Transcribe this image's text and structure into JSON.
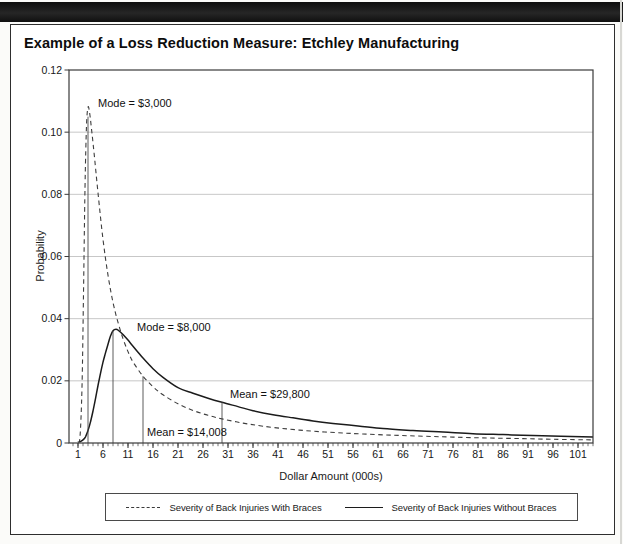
{
  "figure": {
    "title": "Example of a Loss Reduction Measure: Etchley Manufacturing"
  },
  "chart_data": {
    "type": "line",
    "title": "Example of a Loss Reduction Measure: Etchley Manufacturing",
    "xlabel": "Dollar Amount (000s)",
    "ylabel": "Probability",
    "xlim": [
      0,
      104
    ],
    "ylim": [
      0,
      0.12
    ],
    "grid": "horizontal",
    "legend_position": "bottom",
    "y_ticks": [
      {
        "value": 0,
        "label": "0"
      },
      {
        "value": 0.02,
        "label": "0.02"
      },
      {
        "value": 0.04,
        "label": "0.04"
      },
      {
        "value": 0.06,
        "label": "0.06"
      },
      {
        "value": 0.08,
        "label": "0.08"
      },
      {
        "value": 0.1,
        "label": "0.10"
      },
      {
        "value": 0.12,
        "label": "0.12"
      }
    ],
    "x_major_ticks": [
      1,
      6,
      11,
      16,
      21,
      26,
      31,
      36,
      41,
      46,
      51,
      56,
      61,
      66,
      71,
      76,
      81,
      86,
      91,
      96,
      101
    ],
    "x_minor_tick_step": 1,
    "series": [
      {
        "name": "Severity of Back Injuries With Braces",
        "style": "dashed",
        "mode": 3000,
        "mean": 14008,
        "points": [
          [
            1,
            0.0004
          ],
          [
            1.4,
            0.002
          ],
          [
            1.8,
            0.018
          ],
          [
            2.1,
            0.048
          ],
          [
            2.4,
            0.082
          ],
          [
            2.7,
            0.102
          ],
          [
            3,
            0.108
          ],
          [
            3.3,
            0.1065
          ],
          [
            3.7,
            0.101
          ],
          [
            4.2,
            0.0935
          ],
          [
            5,
            0.0805
          ],
          [
            6,
            0.0655
          ],
          [
            7,
            0.054
          ],
          [
            8,
            0.0452
          ],
          [
            9,
            0.0388
          ],
          [
            10,
            0.0336
          ],
          [
            11,
            0.0294
          ],
          [
            12,
            0.0261
          ],
          [
            14,
            0.0215
          ],
          [
            16,
            0.0181
          ],
          [
            18,
            0.0155
          ],
          [
            21,
            0.0126
          ],
          [
            24,
            0.0105
          ],
          [
            27,
            0.0089
          ],
          [
            30,
            0.0077
          ],
          [
            34,
            0.0064
          ],
          [
            38,
            0.0054
          ],
          [
            43,
            0.0045
          ],
          [
            48,
            0.0038
          ],
          [
            53,
            0.0033
          ],
          [
            58,
            0.0029
          ],
          [
            64,
            0.0025
          ],
          [
            70,
            0.0022
          ],
          [
            76,
            0.0019
          ],
          [
            83,
            0.0016
          ],
          [
            90,
            0.0014
          ],
          [
            96,
            0.0012
          ],
          [
            104,
            0.001
          ]
        ]
      },
      {
        "name": "Severity of Back Injuries Without Braces",
        "style": "solid",
        "mode": 8000,
        "mean": 29800,
        "points": [
          [
            1.3,
            0.0003
          ],
          [
            2,
            0.001
          ],
          [
            2.5,
            0.002
          ],
          [
            3,
            0.004
          ],
          [
            3.5,
            0.0068
          ],
          [
            4,
            0.0103
          ],
          [
            4.5,
            0.0143
          ],
          [
            5,
            0.0185
          ],
          [
            5.5,
            0.0224
          ],
          [
            6,
            0.026
          ],
          [
            6.5,
            0.029
          ],
          [
            7,
            0.0318
          ],
          [
            7.5,
            0.0344
          ],
          [
            8,
            0.0361
          ],
          [
            8.6,
            0.0366
          ],
          [
            9.2,
            0.0361
          ],
          [
            10,
            0.0349
          ],
          [
            11,
            0.0331
          ],
          [
            12,
            0.0311
          ],
          [
            13,
            0.0292
          ],
          [
            14,
            0.0273
          ],
          [
            16,
            0.0239
          ],
          [
            18,
            0.0211
          ],
          [
            21,
            0.0178
          ],
          [
            24,
            0.016
          ],
          [
            27,
            0.0144
          ],
          [
            29.8,
            0.0131
          ],
          [
            33,
            0.0117
          ],
          [
            36,
            0.0104
          ],
          [
            40,
            0.0091
          ],
          [
            44,
            0.0081
          ],
          [
            48,
            0.0071
          ],
          [
            52,
            0.0063
          ],
          [
            57,
            0.0055
          ],
          [
            62,
            0.0047
          ],
          [
            68,
            0.004
          ],
          [
            74,
            0.0035
          ],
          [
            80,
            0.003
          ],
          [
            86,
            0.0027
          ],
          [
            92,
            0.0024
          ],
          [
            104,
            0.0019
          ]
        ]
      }
    ],
    "annotations": [
      {
        "id": "mode-with-braces",
        "label": "Mode = $3,000",
        "x": 3,
        "line_top": 0.105
      },
      {
        "id": "mode-without-braces",
        "label": "Mode = $8,000",
        "x": 8,
        "line_top": 0.0361
      },
      {
        "id": "mean-with-braces",
        "label": "Mean = $14,008",
        "x": 14,
        "line_top": 0.0215
      },
      {
        "id": "mean-without-braces",
        "label": "Mean = $29,800",
        "x": 29.8,
        "line_top": 0.0131
      }
    ],
    "legend": [
      "Severity of Back Injuries With Braces",
      "Severity of Back Injuries Without Braces"
    ]
  }
}
